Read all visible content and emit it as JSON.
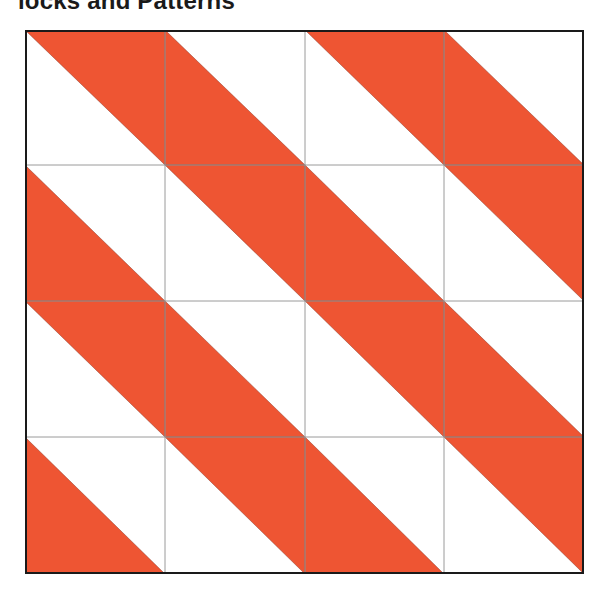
{
  "title": "locks and Patterns",
  "colors": {
    "fill": "#EE5533",
    "background": "#FFFFFF",
    "grid_line": "#9A9A9A",
    "fill_edge": "#8A3322",
    "border": "#1A1A1A"
  },
  "grid": {
    "rows": 4,
    "cols": 4,
    "column_edges_px": [
      25,
      165,
      305,
      444,
      584
    ],
    "row_edges_px": [
      30,
      165,
      301,
      437,
      574
    ],
    "cells": [
      [
        "upper-right",
        "lower-left",
        "upper-right",
        "lower-left"
      ],
      [
        "lower-left",
        "upper-right",
        "lower-left",
        "upper-right"
      ],
      [
        "upper-right",
        "lower-left",
        "upper-right",
        "lower-left"
      ],
      [
        "lower-left",
        "upper-right",
        "lower-left",
        "upper-right"
      ]
    ],
    "diagonal": "top-left to bottom-right"
  }
}
